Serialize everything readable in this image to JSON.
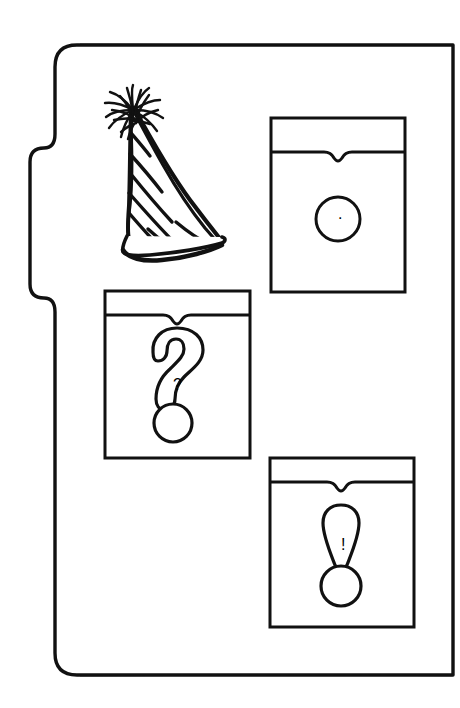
{
  "canvas": {
    "width": 460,
    "height": 708,
    "background_color": "#ffffff",
    "ink_color": "#111111",
    "style": "black-and-white line drawing, hand-drawn clip art"
  },
  "scene": {
    "title": "Party hat and three punctuation cards",
    "description": "A rounded rectangular panel with a tab on its left edge contains a hand-drawn striped party hat and three rectangular cards, each showing a punctuation mark."
  },
  "panel": {
    "label": "Rounded panel with left tab",
    "stroke_color": "#111111",
    "stroke_width": 3,
    "bounds": {
      "x": 55,
      "y": 45,
      "width": 398,
      "height": 630
    },
    "corner_radius_top_left": 22,
    "corner_radius_bottom_left": 22,
    "corner_radius_top_right": 0,
    "corner_radius_bottom_right": 0,
    "tab": {
      "label": "left side tab",
      "x": 30,
      "y": 148,
      "width": 25,
      "height": 150,
      "corner_radius": 14
    }
  },
  "party_hat": {
    "label": "striped party hat",
    "stroke_color": "#111111",
    "bounds": {
      "x": 95,
      "y": 85,
      "width": 145,
      "height": 170
    },
    "stripe_count": 7,
    "has_tassel": true,
    "tassel_strand_count": 14,
    "has_brim": true
  },
  "cards": [
    {
      "id": "card-period",
      "label": "period card",
      "symbol_name": "period",
      "symbol_glyph": ".",
      "bounds": {
        "x": 271,
        "y": 118,
        "width": 134,
        "height": 174
      },
      "header_height": 34,
      "notch": {
        "width": 28,
        "depth": 10
      },
      "dot": {
        "cx": 0.5,
        "cy": 0.58,
        "r": 22
      },
      "stroke_color": "#111111",
      "stroke_width": 3
    },
    {
      "id": "card-question",
      "label": "question mark card",
      "symbol_name": "question-mark",
      "symbol_glyph": "?",
      "bounds": {
        "x": 105,
        "y": 291,
        "width": 145,
        "height": 167
      },
      "header_height": 24,
      "notch": {
        "width": 28,
        "depth": 10
      },
      "dot": {
        "cx": 0.47,
        "cy": 0.79,
        "r": 19
      },
      "stroke_color": "#111111",
      "stroke_width": 3
    },
    {
      "id": "card-exclamation",
      "label": "exclamation mark card",
      "symbol_name": "exclamation-mark",
      "symbol_glyph": "!",
      "bounds": {
        "x": 270,
        "y": 458,
        "width": 144,
        "height": 169
      },
      "header_height": 24,
      "notch": {
        "width": 30,
        "depth": 9
      },
      "dot": {
        "cx": 0.5,
        "cy": 0.76,
        "r": 20
      },
      "stroke_color": "#111111",
      "stroke_width": 3
    }
  ]
}
